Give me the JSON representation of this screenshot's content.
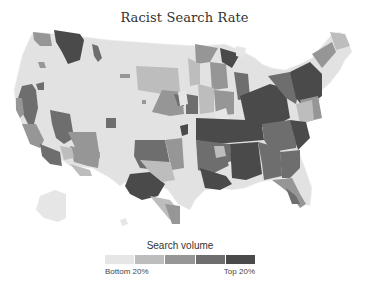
{
  "title": "Racist Search Rate",
  "legend": {
    "title": "Search volume",
    "low_label": "Bottom 20%",
    "high_label": "Top 20%",
    "bins": [
      "#e6e6e6",
      "#bdbdbd",
      "#969696",
      "#6e6e6e",
      "#4a4a4a"
    ]
  },
  "map": {
    "region": "United States (media markets)",
    "colors": {
      "base": "#e2e2e2",
      "q2": "#bdbdbd",
      "q3": "#969696",
      "q4": "#6e6e6e",
      "q5": "#4a4a4a",
      "border": "#f4f4f4"
    }
  }
}
